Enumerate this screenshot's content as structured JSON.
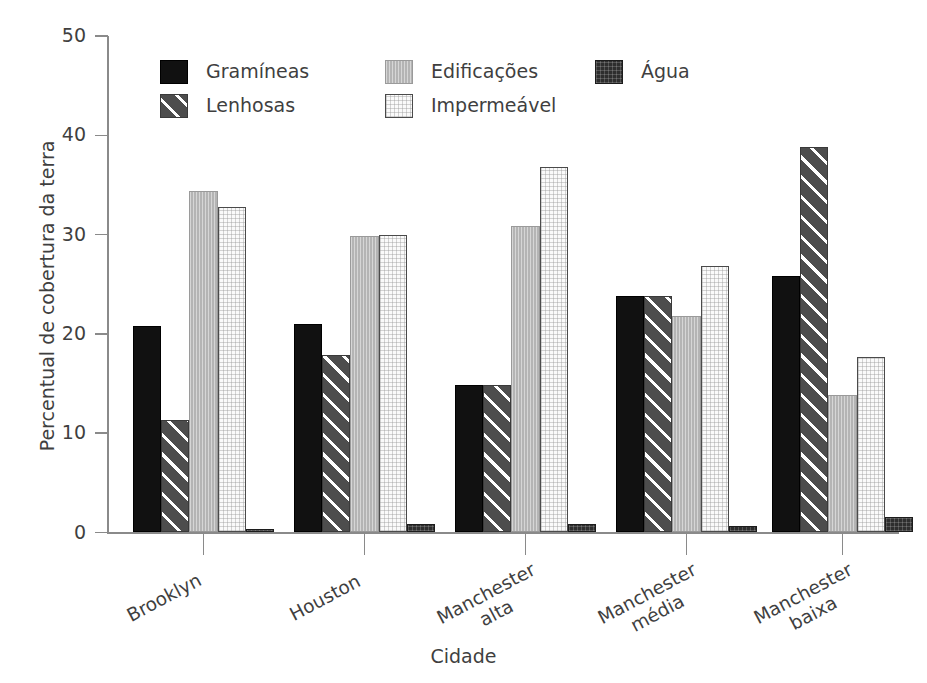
{
  "chart_data": {
    "type": "bar",
    "title": "",
    "subtitle": "",
    "xlabel": "Cidade",
    "ylabel": "Percentual de cobertura da terra",
    "ylim": [
      0,
      50
    ],
    "yticks": [
      0,
      10,
      20,
      30,
      40,
      50
    ],
    "grid": false,
    "legend_position": "top-inside",
    "categories": [
      "Brooklyn",
      "Houston",
      "Manchester alta",
      "Manchester média",
      "Manchester baixa"
    ],
    "series": [
      {
        "name": "Gramíneas",
        "color": "#111111",
        "pattern": "solid",
        "values": [
          20.8,
          21.0,
          14.9,
          23.8,
          25.8
        ]
      },
      {
        "name": "Lenhosas",
        "color": "#4d4d4d",
        "pattern": "diagonal",
        "values": [
          11.3,
          17.9,
          14.9,
          23.8,
          38.8
        ]
      },
      {
        "name": "Edificações",
        "color": "#b4b4b4",
        "pattern": "vertical",
        "values": [
          34.4,
          29.9,
          30.9,
          21.8,
          13.8
        ]
      },
      {
        "name": "Impermeável",
        "color": "#fafafa",
        "pattern": "cross-light",
        "values": [
          32.8,
          30.0,
          36.8,
          26.8,
          17.7
        ]
      },
      {
        "name": "Água",
        "color": "#2e2e2e",
        "pattern": "cross-dark",
        "values": [
          0.4,
          0.9,
          0.85,
          0.7,
          1.6
        ]
      }
    ]
  },
  "axis": {
    "y_title": "Percentual de cobertura da terra",
    "x_title": "Cidade",
    "y_tick_labels": [
      "0",
      "10",
      "20",
      "30",
      "40",
      "50"
    ]
  },
  "category_labels": [
    {
      "line1": "Brooklyn",
      "line2": ""
    },
    {
      "line1": "Houston",
      "line2": ""
    },
    {
      "line1": "Manchester",
      "line2": "alta"
    },
    {
      "line1": "Manchester",
      "line2": "média"
    },
    {
      "line1": "Manchester",
      "line2": "baixa"
    }
  ],
  "legend": {
    "items": [
      {
        "label": "Gramíneas",
        "swatch": "swatch-gramineas"
      },
      {
        "label": "Lenhosas",
        "swatch": "swatch-lenhosas"
      },
      {
        "label": "Edificações",
        "swatch": "swatch-edificacoes"
      },
      {
        "label": "Impermeável",
        "swatch": "swatch-impermeavel"
      },
      {
        "label": "Água",
        "swatch": "swatch-agua"
      }
    ]
  }
}
